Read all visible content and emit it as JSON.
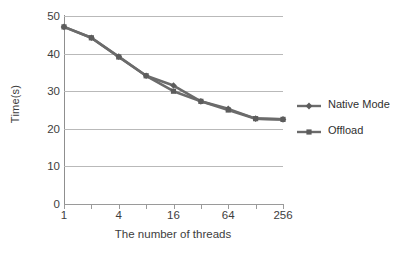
{
  "chart_data": {
    "type": "line",
    "title": "",
    "xlabel": "The number of threads",
    "ylabel": "Time(s)",
    "x": [
      1,
      2,
      4,
      8,
      16,
      32,
      64,
      128,
      256
    ],
    "x_tick_labels": [
      "1",
      "",
      "4",
      "",
      "16",
      "",
      "64",
      "",
      "256"
    ],
    "x_labeled_ticks": [
      "1",
      "4",
      "16",
      "64",
      "256"
    ],
    "x_scale": "log2",
    "ylim": [
      0,
      50
    ],
    "y_ticks": [
      0,
      10,
      20,
      30,
      40,
      50
    ],
    "y_tick_labels": [
      "0",
      "10",
      "20",
      "30",
      "40",
      "50"
    ],
    "grid": "horizontal",
    "legend_position": "right",
    "series": [
      {
        "name": "Native Mode",
        "marker": "diamond",
        "color": "#6b6b6b",
        "values": [
          47.1,
          44.2,
          39.2,
          34.1,
          31.5,
          27.3,
          25.3,
          22.7,
          22.5
        ]
      },
      {
        "name": "Offload",
        "marker": "square",
        "color": "#6b6b6b",
        "values": [
          47.1,
          44.2,
          39.1,
          34.1,
          30.0,
          27.3,
          25.0,
          22.7,
          22.5
        ]
      }
    ]
  },
  "axes": {
    "y_title": "Time(s)",
    "x_title": "The number of threads"
  },
  "legend": {
    "items": [
      {
        "label": "Native Mode",
        "marker": "diamond-marker-icon"
      },
      {
        "label": "Offload",
        "marker": "square-marker-icon"
      }
    ]
  },
  "colors": {
    "series": "#6b6b6b",
    "series_dark": "#5c5c5c",
    "gridline": "#b9b9b9",
    "axis": "#8f8f8f",
    "text": "#3d3d3d",
    "background": "#ffffff"
  }
}
